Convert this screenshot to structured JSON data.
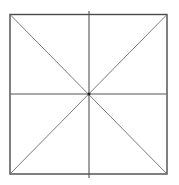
{
  "diagram": {
    "type": "square-with-diagonals-and-midlines",
    "shapes": [
      {
        "kind": "square",
        "label": ""
      },
      {
        "kind": "diagonal",
        "from": "top-left",
        "to": "bottom-right"
      },
      {
        "kind": "diagonal",
        "from": "top-right",
        "to": "bottom-left"
      },
      {
        "kind": "midline",
        "orientation": "vertical"
      },
      {
        "kind": "midline",
        "orientation": "horizontal"
      },
      {
        "kind": "intersection-point",
        "location": "center"
      }
    ],
    "colors": {
      "stroke": "#4a4a4a",
      "background": "#ffffff"
    }
  }
}
